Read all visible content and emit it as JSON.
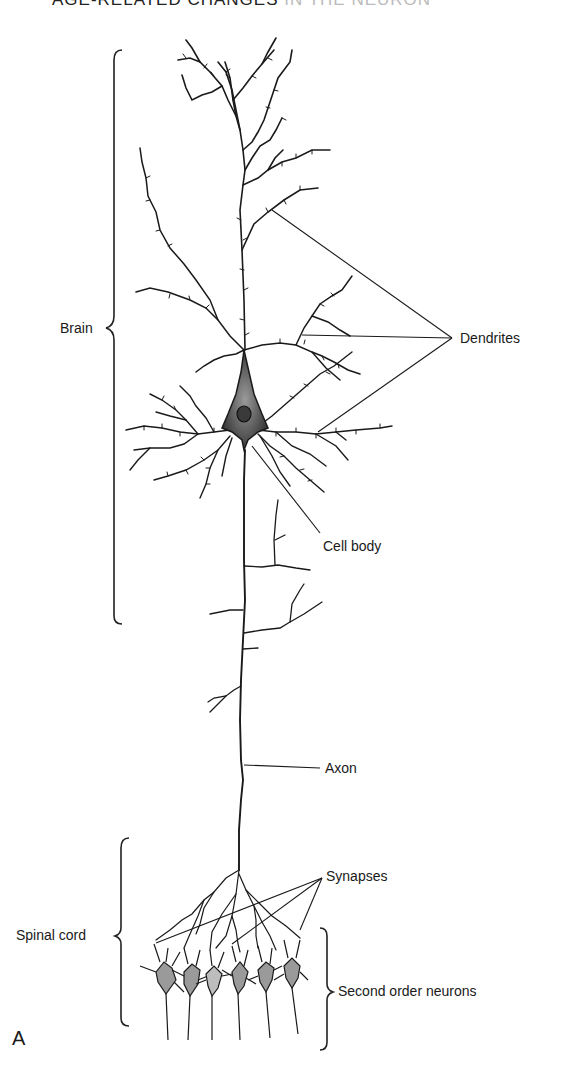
{
  "header": {
    "running_title_visible": "AGE-RELATED CHANGES",
    "running_title_faded": "IN THE NEURON"
  },
  "labels": {
    "brain": "Brain",
    "dendrites": "Dendrites",
    "cell_body": "Cell body",
    "axon": "Axon",
    "synapses": "Synapses",
    "spinal_cord": "Spinal cord",
    "second_order_neurons": "Second order neurons"
  },
  "panel_label": "A",
  "colors": {
    "ink": "#1a1a1a",
    "soma_fill": "#6b6b6b",
    "second_order_fill": "#9a9a9a",
    "background": "#ffffff"
  }
}
